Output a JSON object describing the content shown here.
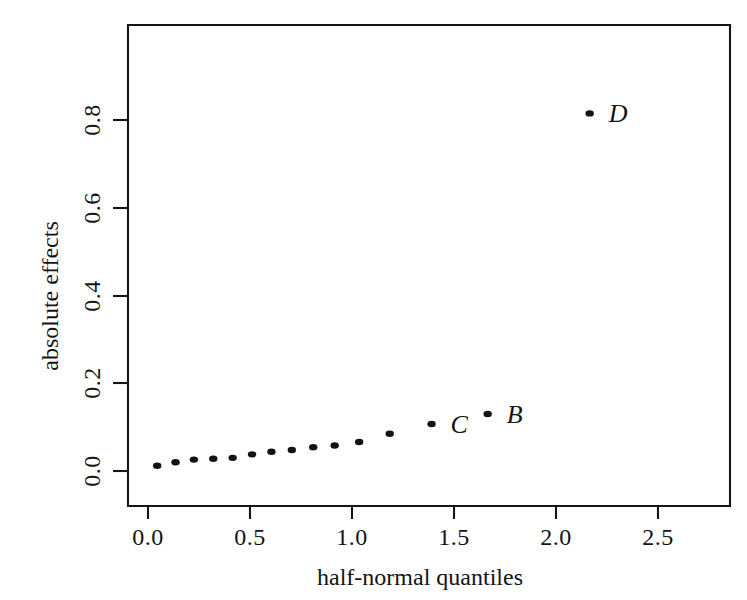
{
  "chart_data": {
    "type": "scatter",
    "title": "",
    "xlabel": "half-normal quantiles",
    "ylabel": "absolute effects",
    "xlim": [
      -0.13,
      2.85
    ],
    "ylim": [
      -0.025,
      0.875
    ],
    "xticks": [
      0.0,
      0.5,
      1.0,
      1.5,
      2.0,
      2.5
    ],
    "xticklabels": [
      "0.0",
      "0.5",
      "1.0",
      "1.5",
      "2.0",
      "2.5"
    ],
    "yticks": [
      0.0,
      0.2,
      0.4,
      0.6,
      0.8
    ],
    "yticklabels": [
      "0.0",
      "0.2",
      "0.4",
      "0.6",
      "0.8"
    ],
    "grid": false,
    "legend": false,
    "ylabel_rotation": 90,
    "yticklabel_rotation": 90,
    "marker": "filled-circle",
    "marker_color": "#121212",
    "frame_color": "#161616",
    "background": "#ffffff",
    "points": [
      {
        "x": 0.045,
        "y": 0.012,
        "label": ""
      },
      {
        "x": 0.135,
        "y": 0.02,
        "label": ""
      },
      {
        "x": 0.225,
        "y": 0.026,
        "label": ""
      },
      {
        "x": 0.32,
        "y": 0.028,
        "label": ""
      },
      {
        "x": 0.415,
        "y": 0.03,
        "label": ""
      },
      {
        "x": 0.51,
        "y": 0.038,
        "label": ""
      },
      {
        "x": 0.605,
        "y": 0.044,
        "label": ""
      },
      {
        "x": 0.705,
        "y": 0.048,
        "label": ""
      },
      {
        "x": 0.81,
        "y": 0.054,
        "label": ""
      },
      {
        "x": 0.915,
        "y": 0.058,
        "label": ""
      },
      {
        "x": 1.035,
        "y": 0.066,
        "label": ""
      },
      {
        "x": 1.185,
        "y": 0.085,
        "label": ""
      },
      {
        "x": 1.39,
        "y": 0.107,
        "label": "C"
      },
      {
        "x": 1.665,
        "y": 0.13,
        "label": "B"
      },
      {
        "x": 2.165,
        "y": 0.815,
        "label": "D"
      }
    ],
    "annotations": [
      {
        "text": "D",
        "x": 2.165,
        "y": 0.815
      },
      {
        "text": "C",
        "x": 1.39,
        "y": 0.107
      },
      {
        "text": "B",
        "x": 1.665,
        "y": 0.13
      }
    ]
  }
}
